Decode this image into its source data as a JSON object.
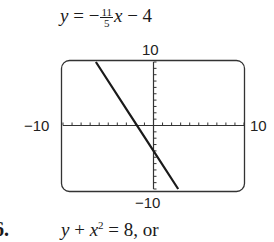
{
  "equation": {
    "lhs": "y",
    "equals": "=",
    "sign": "−",
    "numerator": "11",
    "denominator": "5",
    "variable": "x",
    "tail": "− 4"
  },
  "window_labels": {
    "ymax": "10",
    "ymin": "−10",
    "xmin": "−10",
    "xmax": "10"
  },
  "next_problem": {
    "number": "6.",
    "lhs_y": "y",
    "plus": " + ",
    "x": "x",
    "exp": "2",
    "rest": " = 8, or"
  },
  "chart_data": {
    "type": "line",
    "xlabel": "",
    "ylabel": "",
    "xlim": [
      -10,
      10
    ],
    "ylim": [
      -10,
      10
    ],
    "x_ticks_step": 1,
    "y_ticks_step": 1,
    "grid": false,
    "legend": "none",
    "series": [
      {
        "name": "y = -11/5 x - 4",
        "slope": -2.2,
        "intercept": -4,
        "x": [
          -6.36,
          -2.73,
          0,
          2.73
        ],
        "y": [
          10,
          2,
          -4,
          -10
        ]
      }
    ]
  }
}
